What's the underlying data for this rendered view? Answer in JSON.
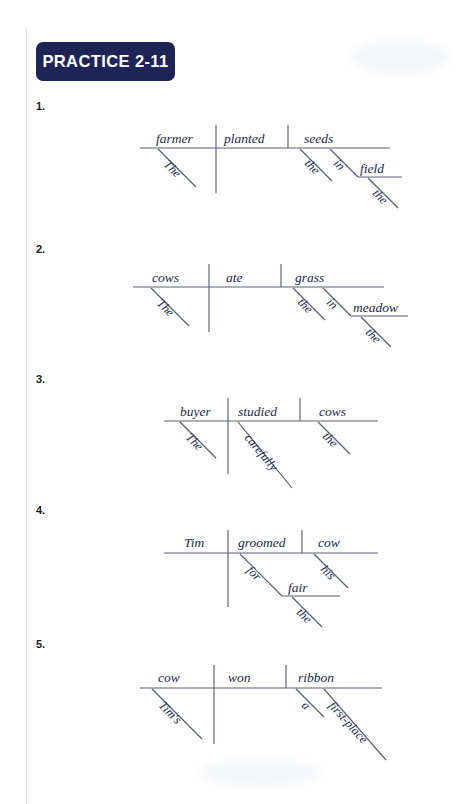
{
  "page": {
    "background_color": "#fefefe",
    "badge_color": "#1f2456",
    "line_color": "#5a6075",
    "word_color": "#232a4a"
  },
  "header": {
    "badge_label": "PRACTICE 2-11"
  },
  "exercises": [
    {
      "number": "1.",
      "sentence": "The farmer planted seeds in the field.",
      "subject": "farmer",
      "subject_modifier": "The",
      "verb": "planted",
      "object": "seeds",
      "object_modifier": "the",
      "preposition": "in",
      "prep_object": "field",
      "prep_object_modifier": "the"
    },
    {
      "number": "2.",
      "sentence": "The cows ate grass in the meadow.",
      "subject": "cows",
      "subject_modifier": "The",
      "verb": "ate",
      "object": "grass",
      "object_modifier": "the",
      "preposition": "in",
      "prep_object": "meadow",
      "prep_object_modifier": "the"
    },
    {
      "number": "3.",
      "sentence": "The buyer studied the cows carefully.",
      "subject": "buyer",
      "subject_modifier": "The",
      "verb": "studied",
      "verb_modifier": "carefully",
      "object": "cows",
      "object_modifier": "the"
    },
    {
      "number": "4.",
      "sentence": "Tim groomed his cow for the fair.",
      "subject": "Tim",
      "verb": "groomed",
      "object": "cow",
      "object_modifier": "his",
      "preposition": "for",
      "prep_object": "fair",
      "prep_object_modifier": "the"
    },
    {
      "number": "5.",
      "sentence": "Tim's cow won a first-place ribbon.",
      "subject": "cow",
      "subject_modifier": "Tim's",
      "verb": "won",
      "object": "ribbon",
      "object_modifier": "a",
      "object_modifier_2": "first-place"
    }
  ]
}
